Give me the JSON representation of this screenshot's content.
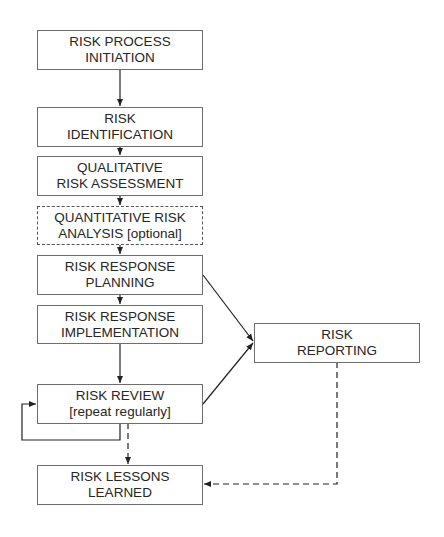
{
  "diagram": {
    "type": "flowchart",
    "nodes": [
      {
        "id": "initiation",
        "lines": [
          "RISK PROCESS",
          "INITIATION"
        ],
        "style": "solid"
      },
      {
        "id": "identification",
        "lines": [
          "RISK",
          "IDENTIFICATION"
        ],
        "style": "solid"
      },
      {
        "id": "qualitative",
        "lines": [
          "QUALITATIVE",
          "RISK ASSESSMENT"
        ],
        "style": "solid"
      },
      {
        "id": "quantitative",
        "lines": [
          "QUANTITATIVE RISK",
          "ANALYSIS [optional]"
        ],
        "style": "dashed"
      },
      {
        "id": "response-planning",
        "lines": [
          "RISK RESPONSE",
          "PLANNING"
        ],
        "style": "solid"
      },
      {
        "id": "response-implementation",
        "lines": [
          "RISK RESPONSE",
          "IMPLEMENTATION"
        ],
        "style": "solid"
      },
      {
        "id": "review",
        "lines": [
          "RISK REVIEW",
          "[repeat regularly]"
        ],
        "style": "solid"
      },
      {
        "id": "lessons",
        "lines": [
          "RISK LESSONS",
          "LEARNED"
        ],
        "style": "solid"
      },
      {
        "id": "reporting",
        "lines": [
          "RISK",
          "REPORTING"
        ],
        "style": "solid"
      }
    ],
    "edges": [
      {
        "from": "initiation",
        "to": "identification",
        "style": "solid"
      },
      {
        "from": "identification",
        "to": "qualitative",
        "style": "solid"
      },
      {
        "from": "qualitative",
        "to": "quantitative",
        "style": "solid"
      },
      {
        "from": "quantitative",
        "to": "response-planning",
        "style": "solid"
      },
      {
        "from": "response-planning",
        "to": "response-implementation",
        "style": "solid"
      },
      {
        "from": "response-implementation",
        "to": "review",
        "style": "solid"
      },
      {
        "from": "review",
        "to": "review",
        "style": "solid",
        "label": "loop"
      },
      {
        "from": "response-planning",
        "to": "reporting",
        "style": "solid"
      },
      {
        "from": "review",
        "to": "reporting",
        "style": "solid"
      },
      {
        "from": "review",
        "to": "lessons",
        "style": "dashed"
      },
      {
        "from": "reporting",
        "to": "lessons",
        "style": "dashed"
      }
    ],
    "colors": {
      "line": "#222222",
      "border": "#6e6e6e",
      "text": "#262626",
      "background": "#ffffff"
    }
  }
}
